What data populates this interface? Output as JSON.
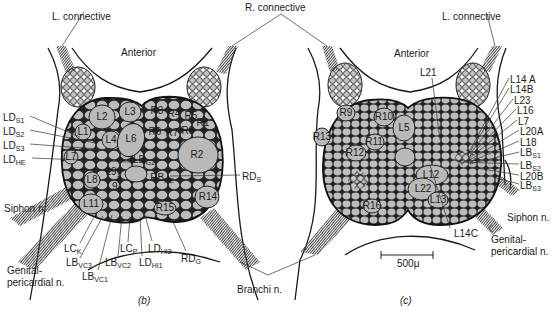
{
  "colors": {
    "cell_fill": "#b9b9b9",
    "outline": "#1a1a1a",
    "background": "#ffffff",
    "nerve_hatch": "#555555"
  },
  "shared_labels": {
    "r_connective": "R. connective",
    "branchi": "Branchi n."
  },
  "panel_b": {
    "caption": "(b)",
    "l_connective": "L. connective",
    "anterior": "Anterior",
    "siphon": "Siphon n.",
    "genital_1": "Genital-",
    "genital_2": "pericardial n.",
    "cells": [
      {
        "id": "L1",
        "t": "L1",
        "x": 83,
        "y": 132
      },
      {
        "id": "L2",
        "t": "L2",
        "x": 102,
        "y": 117
      },
      {
        "id": "L3",
        "t": "L3",
        "x": 130,
        "y": 112
      },
      {
        "id": "L4",
        "t": "L4",
        "x": 111,
        "y": 140
      },
      {
        "id": "L6",
        "t": "L6",
        "x": 131,
        "y": 139
      },
      {
        "id": "L7",
        "t": "L7",
        "x": 71,
        "y": 157
      },
      {
        "id": "L8",
        "t": "L8",
        "x": 92,
        "y": 180
      },
      {
        "id": "L11",
        "t": "L11",
        "x": 91,
        "y": 204
      },
      {
        "id": "R3",
        "t": "R3",
        "x": 157,
        "y": 111
      },
      {
        "id": "R4",
        "t": "R4",
        "x": 174,
        "y": 114
      },
      {
        "id": "R5",
        "t": "R5",
        "x": 191,
        "y": 116
      },
      {
        "id": "R1",
        "t": "R1",
        "x": 203,
        "y": 123
      },
      {
        "id": "R6",
        "t": "R6",
        "x": 155,
        "y": 132
      },
      {
        "id": "R7",
        "t": "R7",
        "x": 172,
        "y": 133
      },
      {
        "id": "R8",
        "t": "R8",
        "x": 188,
        "y": 131
      },
      {
        "id": "R2",
        "t": "R2",
        "x": 197,
        "y": 155
      },
      {
        "id": "R14",
        "t": "R14",
        "x": 208,
        "y": 197
      },
      {
        "id": "R15",
        "t": "R15",
        "x": 165,
        "y": 208
      }
    ],
    "sub_cells": [
      {
        "id": "LDG2",
        "base": "LD",
        "sub": "G2",
        "x": 144,
        "y": 161
      },
      {
        "id": "L91",
        "base": "L9",
        "sub": "1",
        "x": 113,
        "y": 173
      },
      {
        "id": "L92",
        "base": "L9",
        "sub": "2",
        "x": 114,
        "y": 188
      },
      {
        "id": "RBHE",
        "base": "RB",
        "sub": "HE",
        "x": 162,
        "y": 179
      }
    ],
    "left_labels": [
      {
        "id": "LDS1",
        "base": "LD",
        "sub": "S1",
        "x": 3,
        "y": 113
      },
      {
        "id": "LDS2",
        "base": "LD",
        "sub": "S2",
        "x": 3,
        "y": 127
      },
      {
        "id": "LDS3",
        "base": "LD",
        "sub": "S3",
        "x": 3,
        "y": 141
      },
      {
        "id": "LDHE",
        "base": "LD",
        "sub": "HE",
        "x": 3,
        "y": 155
      }
    ],
    "bottom_labels": [
      {
        "id": "LCK",
        "base": "LC",
        "sub": "K",
        "x": 64,
        "y": 244
      },
      {
        "id": "LBVC3",
        "base": "LB",
        "sub": "VC3",
        "x": 66,
        "y": 258
      },
      {
        "id": "LBVC1",
        "base": "LB",
        "sub": "VC1",
        "x": 82,
        "y": 272
      },
      {
        "id": "LBVC2",
        "base": "LB",
        "sub": "VC2",
        "x": 105,
        "y": 258
      },
      {
        "id": "LCP",
        "base": "LC",
        "sub": "P",
        "x": 120,
        "y": 244
      },
      {
        "id": "LDHI2",
        "base": "LD",
        "sub": "HI2",
        "x": 148,
        "y": 244
      },
      {
        "id": "LDHI1",
        "base": "LD",
        "sub": "HI1",
        "x": 139,
        "y": 258
      },
      {
        "id": "RDG",
        "base": "RD",
        "sub": "G",
        "x": 181,
        "y": 254
      }
    ],
    "right_label": {
      "id": "RDS",
      "base": "RD",
      "sub": "S",
      "x": 242,
      "y": 172
    }
  },
  "panel_c": {
    "caption": "(c)",
    "l_connective": "L. connective",
    "anterior": "Anterior",
    "siphon": "Siphon n.",
    "genital_1": "Genital-",
    "genital_2": "pericardial n.",
    "scale_bar": "500μ",
    "l21": "L21",
    "l14c": "L14C",
    "cells": [
      {
        "id": "R9",
        "t": "R9",
        "x": 346,
        "y": 113
      },
      {
        "id": "R10",
        "t": "R10",
        "x": 384,
        "y": 117
      },
      {
        "id": "L5",
        "t": "L5",
        "x": 404,
        "y": 128
      },
      {
        "id": "R13",
        "t": "R13",
        "x": 322,
        "y": 137
      },
      {
        "id": "R11",
        "t": "R11",
        "x": 374,
        "y": 142
      },
      {
        "id": "R12",
        "t": "R12",
        "x": 355,
        "y": 153
      },
      {
        "id": "L12",
        "t": "L12",
        "x": 431,
        "y": 175
      },
      {
        "id": "L22",
        "t": "L22",
        "x": 423,
        "y": 189
      },
      {
        "id": "L13",
        "t": "L13",
        "x": 438,
        "y": 200
      },
      {
        "id": "R16",
        "t": "R16",
        "x": 372,
        "y": 206
      }
    ],
    "right_labels": [
      {
        "id": "L14A",
        "t": "L14 A",
        "x": 510,
        "y": 75
      },
      {
        "id": "L14B",
        "t": "L14B",
        "x": 510,
        "y": 85
      },
      {
        "id": "L23",
        "t": "L23",
        "x": 514,
        "y": 96
      },
      {
        "id": "L16",
        "t": "L16",
        "x": 517,
        "y": 106
      },
      {
        "id": "L7c",
        "t": "L7",
        "x": 518,
        "y": 117
      },
      {
        "id": "L20A",
        "t": "L20A",
        "x": 520,
        "y": 127
      },
      {
        "id": "L18",
        "t": "L18",
        "x": 520,
        "y": 138
      }
    ],
    "right_sub_labels": [
      {
        "id": "LBS1",
        "base": "LB",
        "sub": "S1",
        "x": 520,
        "y": 148
      },
      {
        "id": "LBS2",
        "base": "LB",
        "sub": "S2",
        "x": 520,
        "y": 161
      },
      {
        "id": "L20B",
        "base": "L20B",
        "sub": "",
        "x": 520,
        "y": 172
      },
      {
        "id": "LBS3",
        "base": "LB",
        "sub": "S3",
        "x": 520,
        "y": 181
      }
    ]
  }
}
